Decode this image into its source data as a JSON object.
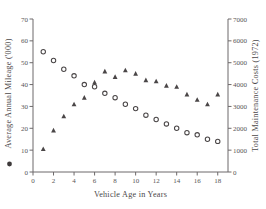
{
  "chart_data": {
    "type": "scatter",
    "title": "",
    "xlabel": "Vehicle Age in Years",
    "ylabel": "Average Annual Mileage ('000)",
    "y2label": "Total Maintenance Costs (1972)",
    "xlim": [
      0,
      19
    ],
    "ylim": [
      0,
      70
    ],
    "y2lim": [
      0,
      7000
    ],
    "xticks": [
      0,
      2,
      4,
      6,
      8,
      10,
      12,
      14,
      16,
      18
    ],
    "yticks": [
      0,
      10,
      20,
      30,
      40,
      50,
      60,
      70
    ],
    "y2ticks": [
      0,
      1000,
      2000,
      3000,
      4000,
      5000,
      6000,
      7000
    ],
    "grid": false,
    "legend_position": "axis-labels",
    "series": [
      {
        "name": "Average Annual Mileage ('000)",
        "marker": "circle",
        "axis": "left",
        "x": [
          1,
          2,
          3,
          4,
          5,
          6,
          7,
          8,
          9,
          10,
          11,
          12,
          13,
          14,
          15,
          16,
          17,
          18
        ],
        "values": [
          55,
          51,
          47,
          44,
          40,
          39,
          36,
          34,
          31,
          29,
          26,
          24,
          22,
          20,
          18,
          17,
          15,
          14
        ]
      },
      {
        "name": "Total Maintenance Costs (1972)",
        "marker": "triangle",
        "axis": "right",
        "x": [
          1,
          2,
          3,
          4,
          5,
          6,
          7,
          8,
          9,
          10,
          11,
          12,
          13,
          14,
          15,
          16,
          17,
          18
        ],
        "values": [
          1050,
          1900,
          2550,
          3100,
          3400,
          4100,
          4600,
          4350,
          4650,
          4500,
          4200,
          4150,
          3950,
          3900,
          3550,
          3300,
          3100,
          3550
        ]
      }
    ]
  },
  "axes": {
    "x_title": "Vehicle Age in Years",
    "y_left_title": "Average Annual Mileage ('000)",
    "y_right_title": "Total Maintenance Costs (1972)",
    "legend_marker_left": "●"
  }
}
